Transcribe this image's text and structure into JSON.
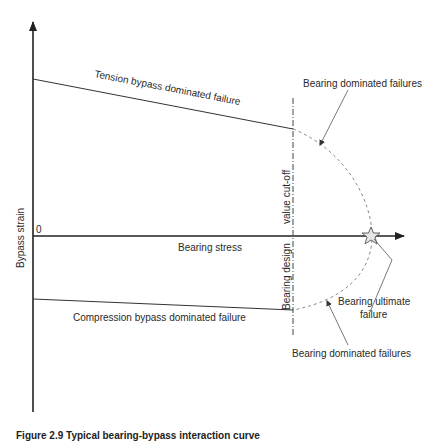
{
  "diagram": {
    "type": "bearing-bypass interaction diagram",
    "axes": {
      "y_label": "Bypass strain",
      "x_label": "Bearing stress",
      "origin_label": "0"
    },
    "lines": {
      "tension": "Tension bypass dominated failure",
      "compression": "Compression bypass dominated failure",
      "cutoff_upper": "value cut-off",
      "cutoff_lower": "Bearing design"
    },
    "annotations": {
      "bearing_dominated_top": "Bearing dominated failures",
      "bearing_dominated_bottom": "Bearing dominated failures",
      "bearing_ultimate_line1": "Bearing ultimate",
      "bearing_ultimate_line2": "failure"
    },
    "caption": "Figure 2.9 Typical bearing-bypass interaction curve"
  },
  "colors": {
    "axis": "#222222",
    "line": "#333333",
    "dashed": "#8a8a8a",
    "text": "#2a2a2a"
  }
}
